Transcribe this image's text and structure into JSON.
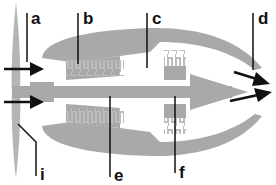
{
  "diagram": {
    "colors": {
      "body": "#a9a9a9",
      "line": "#111111",
      "background": "#ffffff"
    },
    "labels": [
      {
        "id": "a",
        "text": "a"
      },
      {
        "id": "b",
        "text": "b"
      },
      {
        "id": "c",
        "text": "c"
      },
      {
        "id": "d",
        "text": "d"
      },
      {
        "id": "e",
        "text": "e"
      },
      {
        "id": "f",
        "text": "f"
      },
      {
        "id": "i",
        "text": "i"
      }
    ]
  }
}
